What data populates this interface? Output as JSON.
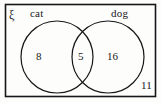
{
  "diagram": {
    "type": "venn-two-set",
    "universal_symbol": "ξ",
    "sets": [
      {
        "id": "cat",
        "label": "cat"
      },
      {
        "id": "dog",
        "label": "dog"
      }
    ],
    "regions": [
      {
        "id": "cat-only",
        "label": "cat only",
        "value": "8"
      },
      {
        "id": "both",
        "label": "cat and dog",
        "value": "5"
      },
      {
        "id": "dog-only",
        "label": "dog only",
        "value": "16"
      },
      {
        "id": "neither",
        "label": "neither",
        "value": "11"
      }
    ],
    "colors": {
      "stroke": "#17171a",
      "background": "#fdfdfb",
      "text": "#17171a"
    }
  }
}
